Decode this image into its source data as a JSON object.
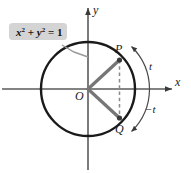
{
  "figure": {
    "name": "unit-circle-t-negative-t-diagram",
    "background_color": "#ffffff",
    "stroke_color": "#1a1a1a",
    "radius_color": "#6b6b6b",
    "callout_fill": "#d4d4d4",
    "axis_color": "#555555"
  },
  "callout": {
    "equation_var_x": "x",
    "equation_sup_2a": "2",
    "equation_plus": " + ",
    "equation_var_y": "y",
    "equation_sup_2b": "2",
    "equation_equals": " = 1",
    "full_text": "x2 + y2 = 1"
  },
  "axes": {
    "x_label": "x",
    "y_label": "y"
  },
  "points": {
    "origin_label": "O",
    "p_label": "P",
    "q_label": "Q"
  },
  "arcs": {
    "positive_label": "t",
    "negative_label": "−t"
  }
}
